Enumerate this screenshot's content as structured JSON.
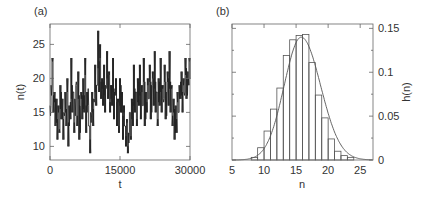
{
  "chart_data": [
    {
      "panel": "(a)",
      "type": "line",
      "title": "",
      "xlabel": "t",
      "ylabel": "n(t)",
      "xlim": [
        0,
        30000
      ],
      "ylim": [
        8,
        28
      ],
      "xticks": [
        0,
        15000,
        30000
      ],
      "xtick_labels": [
        "0",
        "15000",
        "30000"
      ],
      "yticks": [
        10,
        15,
        20,
        25
      ],
      "ytick_labels": [
        "10",
        "15",
        "20",
        "25"
      ],
      "grid": false,
      "color": "#222222",
      "series": [
        {
          "name": "n(t)",
          "x_step": 214,
          "values": [
            16,
            19,
            23,
            15,
            18,
            13,
            17,
            11,
            16,
            12,
            19,
            14,
            17,
            11,
            15,
            18,
            13,
            20,
            10,
            16,
            14,
            23,
            15,
            18,
            12,
            17,
            19,
            13,
            21,
            11,
            16,
            18,
            14,
            20,
            15,
            23,
            12,
            18,
            16,
            13,
            9,
            15,
            18,
            13,
            17,
            22,
            16,
            19,
            27,
            18,
            25,
            17,
            20,
            16,
            22,
            15,
            19,
            24,
            17,
            21,
            15,
            19,
            16,
            23,
            14,
            18,
            20,
            13,
            17,
            12,
            20,
            15,
            18,
            11,
            16,
            13,
            10,
            14,
            9,
            12,
            15,
            11,
            17,
            13,
            22,
            15,
            18,
            13,
            20,
            16,
            22,
            14,
            19,
            16,
            23,
            13,
            18,
            15,
            20,
            17,
            22,
            14,
            19,
            21,
            16,
            24,
            15,
            18,
            13,
            20,
            16,
            23,
            15,
            19,
            17,
            22,
            14,
            18,
            21,
            16,
            24,
            15,
            19,
            13,
            17,
            11,
            16,
            12,
            18,
            15,
            19,
            17,
            21,
            15,
            20,
            18,
            23,
            17,
            21,
            19,
            23,
            20
          ]
        }
      ]
    },
    {
      "panel": "(b)",
      "type": "bar",
      "title": "",
      "xlabel": "n",
      "ylabel": "h(n)",
      "xlim": [
        5,
        27
      ],
      "ylim": [
        0,
        0.155
      ],
      "xticks": [
        5,
        10,
        15,
        20,
        25
      ],
      "xtick_labels": [
        "5",
        "10",
        "15",
        "20",
        "25"
      ],
      "yticks": [
        0,
        0.05,
        0.1,
        0.15
      ],
      "ytick_labels": [
        "0",
        "0.05",
        "0.1",
        "0.15"
      ],
      "y_axis_side": "right",
      "grid": false,
      "categories": [
        8,
        9,
        10,
        11,
        12,
        13,
        14,
        15,
        16,
        17,
        18,
        19,
        20,
        21,
        22,
        23
      ],
      "series": [
        {
          "name": "histogram",
          "bin_width": 1,
          "values": [
            0.003,
            0.014,
            0.033,
            0.058,
            0.082,
            0.119,
            0.137,
            0.142,
            0.143,
            0.111,
            0.074,
            0.048,
            0.024,
            0.01,
            0.005,
            0.003
          ]
        },
        {
          "name": "fit curve",
          "type": "line",
          "shape": "gaussian-like",
          "peak_x": 15.8,
          "peak_y": 0.14,
          "sigma": 2.8
        }
      ]
    }
  ],
  "panels": {
    "a": {
      "label": "(a)"
    },
    "b": {
      "label": "(b)"
    }
  }
}
